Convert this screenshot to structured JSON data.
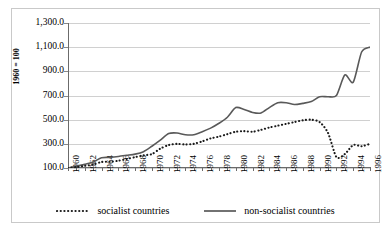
{
  "figure": {
    "ylabel": "1960 = 100"
  },
  "legend": {
    "position": "bottom-center",
    "entries": [
      {
        "label": "socialist countries",
        "style": "dotted",
        "color": "#1a1a1a"
      },
      {
        "label": "non-socialist countries",
        "style": "solid",
        "color": "#595959"
      }
    ]
  },
  "axes": {
    "y_tick_labels": [
      "1,300.0",
      "1,100.0",
      "900.0",
      "700.0",
      "500.0",
      "300.0",
      "100.0"
    ],
    "y_tick_values": [
      1300,
      1100,
      900,
      700,
      500,
      300,
      100
    ],
    "x_tick_labels": [
      "1960",
      "1962",
      "1964",
      "1966",
      "1968",
      "1970",
      "1972",
      "1974",
      "1976",
      "1978",
      "1980",
      "1982",
      "1984",
      "1986",
      "1988",
      "1990",
      "1992",
      "1994",
      "1996"
    ]
  },
  "chart_data": {
    "type": "line",
    "title": "",
    "subtitle": "",
    "xlabel": "",
    "ylabel": "1960 = 100",
    "grid": true,
    "legend_position": "bottom-center",
    "xlim": [
      1960,
      1996
    ],
    "ylim": [
      100,
      1300
    ],
    "x": [
      1960,
      1961,
      1962,
      1963,
      1964,
      1965,
      1966,
      1967,
      1968,
      1969,
      1970,
      1971,
      1972,
      1973,
      1974,
      1975,
      1976,
      1977,
      1978,
      1979,
      1980,
      1981,
      1982,
      1983,
      1984,
      1985,
      1986,
      1987,
      1988,
      1989,
      1990,
      1991,
      1992,
      1993,
      1994,
      1995,
      1996
    ],
    "series": [
      {
        "name": "socialist countries",
        "style": "dotted",
        "color": "#1a1a1a",
        "values": [
          100,
          108,
          118,
          128,
          150,
          152,
          160,
          175,
          190,
          205,
          215,
          260,
          290,
          300,
          295,
          300,
          320,
          345,
          360,
          380,
          400,
          405,
          400,
          415,
          435,
          450,
          465,
          480,
          495,
          500,
          480,
          390,
          190,
          215,
          290,
          280,
          300
        ]
      },
      {
        "name": "non-socialist countries",
        "style": "solid",
        "color": "#595959",
        "values": [
          100,
          115,
          130,
          150,
          185,
          188,
          195,
          205,
          215,
          235,
          280,
          330,
          385,
          390,
          375,
          375,
          400,
          430,
          470,
          520,
          600,
          585,
          560,
          555,
          600,
          640,
          640,
          625,
          635,
          650,
          690,
          690,
          700,
          870,
          810,
          1060,
          1100
        ]
      }
    ]
  }
}
